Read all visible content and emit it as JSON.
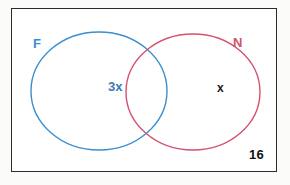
{
  "diagram": {
    "type": "venn-two-set",
    "title": "",
    "frame": {
      "border_color": "#2b2b2b",
      "background": "#ffffff"
    },
    "sets": [
      {
        "id": "F",
        "label": "F",
        "color": "#3a8fd0",
        "position": "left"
      },
      {
        "id": "N",
        "label": "N",
        "color": "#d4516f",
        "position": "right"
      }
    ],
    "region_labels": [
      {
        "id": "intersection",
        "text": "3x",
        "color": "#3a7bb8",
        "region": "F-and-N"
      },
      {
        "id": "n-only",
        "text": "x",
        "color": "#1a1a1a",
        "region": "N-only"
      },
      {
        "id": "outside",
        "text": "16",
        "color": "#111111",
        "region": "outside-both"
      }
    ]
  }
}
